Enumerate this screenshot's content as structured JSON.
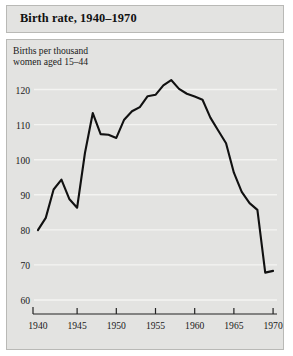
{
  "title": "Birth rate, 1940–1970",
  "chart_data": {
    "type": "line",
    "title": "Birth rate, 1940–1970",
    "xlabel": "",
    "ylabel": "Births per thousand women aged 15–44",
    "ylabel_line1": "Births per thousand",
    "ylabel_line2": "women aged 15–44",
    "xlim": [
      1939.5,
      1970.5
    ],
    "ylim": [
      56,
      125
    ],
    "yticks": [
      60,
      70,
      80,
      90,
      100,
      110,
      120
    ],
    "ytick_labels": [
      "60",
      "70",
      "80",
      "90",
      "100",
      "110",
      "120"
    ],
    "xticks": [
      1940,
      1945,
      1950,
      1955,
      1960,
      1965,
      1970
    ],
    "xtick_labels": [
      "1940",
      "1945",
      "1950",
      "1955",
      "1960",
      "1965",
      "1970"
    ],
    "grid": "horizontal-white",
    "legend": null,
    "line_color": "#111111",
    "background_color": "#e3e3e1",
    "gridline_color": "#f4f4f2",
    "x": [
      1940,
      1941,
      1942,
      1943,
      1944,
      1945,
      1946,
      1947,
      1948,
      1949,
      1950,
      1951,
      1952,
      1953,
      1954,
      1955,
      1956,
      1957,
      1958,
      1959,
      1960,
      1961,
      1962,
      1963,
      1964,
      1965,
      1966,
      1967,
      1968,
      1969,
      1970
    ],
    "y": [
      79.9,
      83.4,
      91.5,
      94.3,
      88.8,
      86.3,
      101.9,
      113.3,
      107.3,
      107.1,
      106.2,
      111.4,
      113.8,
      115.0,
      118.1,
      118.5,
      121.2,
      122.7,
      120.2,
      118.8,
      118.0,
      117.1,
      112.0,
      108.3,
      104.7,
      96.3,
      90.8,
      87.6,
      85.7,
      67.8,
      68.3
    ],
    "annotations": [
      {
        "label": "peak",
        "x": 1957,
        "y": 122.7
      },
      {
        "label": "wartime dip",
        "x": 1945,
        "y": 86.3
      },
      {
        "label": "minimum",
        "x": 1969,
        "y": 67.8
      }
    ]
  }
}
